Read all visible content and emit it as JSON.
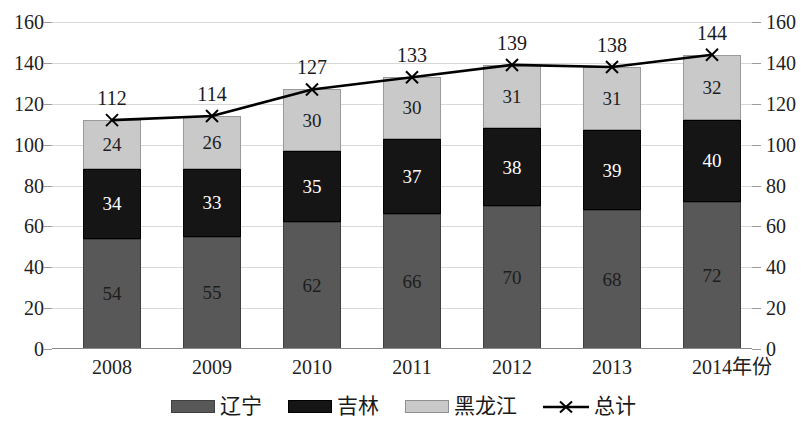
{
  "chart_data": {
    "type": "bar",
    "subtype": "stacked-bar-with-line",
    "title": "",
    "xlabel": "年份",
    "ylabel": "",
    "categories": [
      "2008",
      "2009",
      "2010",
      "2011",
      "2012",
      "2013",
      "2014"
    ],
    "ylim": [
      0,
      160
    ],
    "yticks": [
      0,
      20,
      40,
      60,
      80,
      100,
      120,
      140,
      160
    ],
    "ytick_labels": [
      "0",
      "20",
      "40",
      "60",
      "80",
      "100",
      "120",
      "140",
      "160"
    ],
    "secondary_axis": {
      "position": "right",
      "ylim": [
        0,
        160
      ],
      "yticks": [
        0,
        20,
        40,
        60,
        80,
        100,
        120,
        140,
        160
      ],
      "ytick_labels": [
        "0",
        "20",
        "40",
        "60",
        "80",
        "100",
        "120",
        "140",
        "160"
      ]
    },
    "grid": true,
    "legend_position": "bottom",
    "series": [
      {
        "name": "辽宁",
        "kind": "bar",
        "color": "#585858",
        "values": [
          54,
          55,
          62,
          66,
          70,
          68,
          72
        ]
      },
      {
        "name": "吉林",
        "kind": "bar",
        "color": "#151515",
        "values": [
          34,
          33,
          35,
          37,
          38,
          39,
          40
        ]
      },
      {
        "name": "黑龙江",
        "kind": "bar",
        "color": "#c9c9c9",
        "values": [
          24,
          26,
          30,
          30,
          31,
          31,
          32
        ]
      },
      {
        "name": "总计",
        "kind": "line",
        "marker": "x",
        "color": "#000000",
        "values": [
          112,
          114,
          127,
          133,
          139,
          138,
          144
        ]
      }
    ],
    "data_labels": {
      "辽宁": [
        "54",
        "55",
        "62",
        "66",
        "70",
        "68",
        "72"
      ],
      "吉林": [
        "34",
        "33",
        "35",
        "37",
        "38",
        "39",
        "40"
      ],
      "黑龙江": [
        "24",
        "26",
        "30",
        "30",
        "31",
        "31",
        "32"
      ],
      "总计": [
        "112",
        "114",
        "127",
        "133",
        "139",
        "138",
        "144"
      ]
    }
  },
  "legend": {
    "items": [
      {
        "label": "辽宁",
        "type": "swatch",
        "color": "#585858"
      },
      {
        "label": "吉林",
        "type": "swatch",
        "color": "#151515"
      },
      {
        "label": "黑龙江",
        "type": "swatch",
        "color": "#c9c9c9"
      },
      {
        "label": "总计",
        "type": "line-marker",
        "color": "#000000"
      }
    ]
  }
}
